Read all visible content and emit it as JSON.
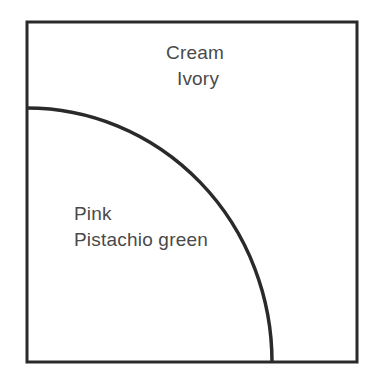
{
  "diagram": {
    "type": "quarter-circle region diagram",
    "stroke_color": "#2a2a2a",
    "background_color": "#ffffff",
    "text_color": "#4a4a4a",
    "regions": [
      {
        "id": "outer",
        "description": "Area outside the quarter arc (top-right)",
        "labels": [
          "Cream",
          "Ivory"
        ]
      },
      {
        "id": "inner",
        "description": "Area inside the quarter arc (bottom-left)",
        "labels": [
          "Pink",
          "Pistachio green"
        ]
      }
    ]
  }
}
